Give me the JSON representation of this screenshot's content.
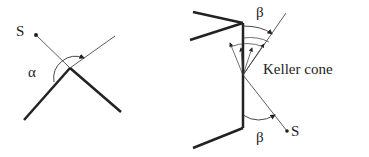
{
  "left_diagram": {
    "source_label": "S",
    "angle_label": "α"
  },
  "right_diagram": {
    "angle_top_label": "β",
    "angle_bottom_label": "β",
    "cone_label": "Keller cone",
    "source_label": "S"
  },
  "colors": {
    "line": "#222222",
    "background": "#ffffff"
  }
}
